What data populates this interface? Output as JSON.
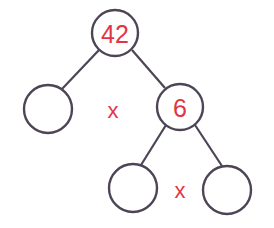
{
  "diagram": {
    "type": "factor-tree",
    "colors": {
      "stroke": "#4d4556",
      "text": "#e23444",
      "background": "#ffffff"
    },
    "nodes": [
      {
        "id": "root",
        "label": "42",
        "cx": 115,
        "cy": 33,
        "r": 23
      },
      {
        "id": "left",
        "label": "",
        "cx": 48,
        "cy": 109,
        "r": 24
      },
      {
        "id": "right",
        "label": "6",
        "cx": 180,
        "cy": 107,
        "r": 23
      },
      {
        "id": "right-left",
        "label": "",
        "cx": 133,
        "cy": 188,
        "r": 24
      },
      {
        "id": "right-right",
        "label": "",
        "cx": 227,
        "cy": 190,
        "r": 24
      }
    ],
    "edges": [
      {
        "from": "root",
        "to": "left"
      },
      {
        "from": "root",
        "to": "right"
      },
      {
        "from": "right",
        "to": "right-left"
      },
      {
        "from": "right",
        "to": "right-right"
      }
    ],
    "operators": [
      {
        "symbol": "x",
        "x": 113,
        "y": 110
      },
      {
        "symbol": "x",
        "x": 180,
        "y": 190
      }
    ]
  }
}
